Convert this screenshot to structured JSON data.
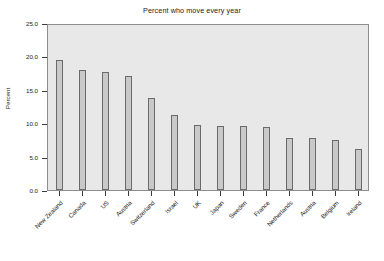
{
  "chart_data": {
    "type": "bar",
    "title": "Percent who move every year",
    "xlabel": "",
    "ylabel": "Percent",
    "ylim": [
      0.0,
      25.0
    ],
    "yticks": [
      "0.0",
      "5.0",
      "10.0",
      "15.0",
      "20.0",
      "25.0"
    ],
    "ytick_values": [
      0.0,
      5.0,
      10.0,
      15.0,
      20.0,
      25.0
    ],
    "grid": false,
    "legend": "none",
    "categories": [
      "New Zealand",
      "Canada",
      "US",
      "Austria",
      "Switzerland",
      "Israel",
      "UK",
      "Japan",
      "Sweden",
      "France",
      "Netherlands",
      "Austria",
      "Belgium",
      "Ireland"
    ],
    "values": [
      19.4,
      18.0,
      17.6,
      17.1,
      13.8,
      11.3,
      9.7,
      9.6,
      9.6,
      9.4,
      7.8,
      7.8,
      7.5,
      6.2
    ],
    "bar_face_color": "#c9c9c9",
    "bar_edge_color": "#6a6a6a",
    "panel_color": "#e8e8e8",
    "axis_color": "#3d3d3d",
    "text_color": "#1a1a1a",
    "background_color": "#ffffff"
  }
}
